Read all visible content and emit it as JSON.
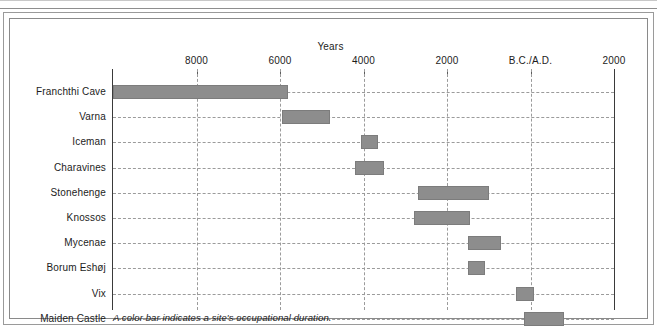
{
  "chart_data": {
    "type": "bar",
    "orientation": "horizontal-range",
    "title": "",
    "xlabel": "Years",
    "ylabel": "",
    "caption": "A color bar indicates a site's occupational duration.",
    "grid": true,
    "legend": null,
    "axis": {
      "tick_labels": [
        "8000",
        "6000",
        "4000",
        "2000",
        "B.C./A.D.",
        "2000"
      ],
      "tick_values": [
        -8000,
        -6000,
        -4000,
        -2000,
        0,
        2000
      ],
      "xlim": [
        -10000,
        2000
      ],
      "era_note": "B.C./A.D."
    },
    "categories": [
      "Franchthi Cave",
      "Varna",
      "Iceman",
      "Charavines",
      "Stonehenge",
      "Knossos",
      "Mycenae",
      "Borum Eshøj",
      "Vix",
      "Maiden Castle"
    ],
    "ranges": [
      {
        "site": "Franchthi Cave",
        "start": -10000,
        "end": -5800
      },
      {
        "site": "Varna",
        "start": -5950,
        "end": -4800
      },
      {
        "site": "Iceman",
        "start": -4050,
        "end": -3650
      },
      {
        "site": "Charavines",
        "start": -4200,
        "end": -3500
      },
      {
        "site": "Stonehenge",
        "start": -2700,
        "end": -1000
      },
      {
        "site": "Knossos",
        "start": -2800,
        "end": -1450
      },
      {
        "site": "Mycenae",
        "start": -1500,
        "end": -700
      },
      {
        "site": "Borum Eshøj",
        "start": -1500,
        "end": -1100
      },
      {
        "site": "Vix",
        "start": -350,
        "end": 80
      },
      {
        "site": "Maiden Castle",
        "start": -150,
        "end": 800
      }
    ],
    "bar_color": "#8d8d8d"
  },
  "colors": {
    "bar": "#8d8d8d",
    "grid": "#9b9b9b",
    "axis": "#3a3a3a",
    "text": "#1c1c1c",
    "frame": "#8a8a8a",
    "background": "#ffffff"
  }
}
